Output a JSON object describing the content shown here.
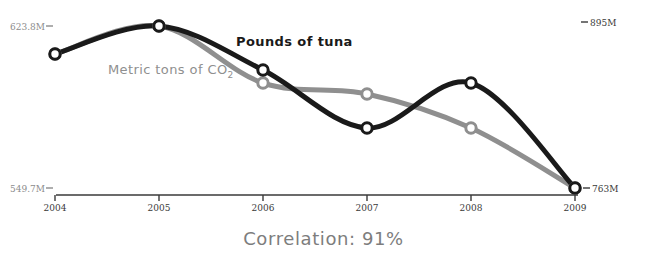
{
  "chart_data": {
    "type": "line",
    "title": "",
    "caption": "Correlation: 91%",
    "x": [
      2004,
      2005,
      2006,
      2007,
      2008,
      2009
    ],
    "categories": [
      "2004",
      "2005",
      "2006",
      "2007",
      "2008",
      "2009"
    ],
    "xlabel": "",
    "grid": false,
    "legend_position": "inline-annotation",
    "series": [
      {
        "name": "Pounds of tuna",
        "color": "#1a1a1a",
        "axis": "right",
        "axis_min_label": "763M",
        "axis_max_label": "895M",
        "ylim": [
          763,
          895
        ],
        "values": [
          808,
          884,
          842,
          801,
          837,
          763
        ],
        "pixels_y": [
          54,
          26,
          70,
          128,
          83,
          188
        ]
      },
      {
        "name": "Metric tons of CO2",
        "color": "#8f8f8f",
        "axis": "left",
        "axis_min_label": "549.7M",
        "axis_max_label": "623.8M",
        "ylim": [
          549.7,
          623.8
        ],
        "values": [
          608.5,
          623.8,
          615.0,
          606.0,
          589.5,
          549.7
        ],
        "pixels_y": [
          54,
          26,
          83,
          94,
          128,
          188
        ]
      }
    ],
    "left_axis": {
      "max_label": "623.8M",
      "min_label": "549.7M"
    },
    "right_axis": {
      "max_label": "895M",
      "min_label": "763M"
    },
    "annotations": [
      {
        "text": "Pounds of tuna",
        "series": "Pounds of tuna"
      },
      {
        "text": "Metric tons of CO",
        "subscript": "2",
        "series": "Metric tons of CO2"
      }
    ]
  },
  "labels": {
    "left_top": "623.8M",
    "left_bottom": "549.7M",
    "right_top": "895M",
    "right_bottom": "763M",
    "tuna": "Pounds of tuna",
    "co2_main": "Metric tons of CO",
    "co2_sub": "2",
    "caption": "Correlation: 91%"
  },
  "ticks": {
    "x": [
      "2004",
      "2005",
      "2006",
      "2007",
      "2008",
      "2009"
    ]
  },
  "colors": {
    "tuna_line": "#1a1a1a",
    "co2_line": "#8f8f8f",
    "axis": "#3a3a3a",
    "label_gray": "#8c8c8c",
    "caption": "#7d7d7d"
  }
}
